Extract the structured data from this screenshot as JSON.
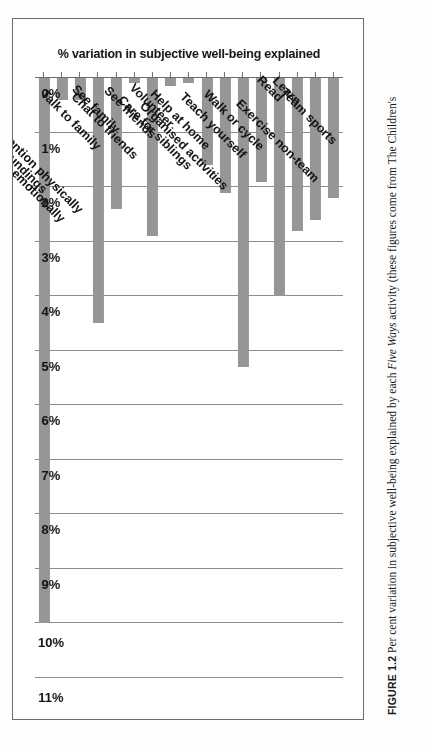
{
  "figure": {
    "label": "FIGURE 1.2",
    "caption_before": "Per cent variation in subjective well-being explained by each ",
    "caption_italic": "Five Ways",
    "caption_after": " activity (these figures come from The Children's"
  },
  "colors": {
    "bar": "#969696",
    "gridline": "#8d8d8d",
    "axis": "#6b6b6b",
    "text": "#111111",
    "frame": "#6b6b6b",
    "page_background": "#ffffff"
  },
  "chart_data": {
    "type": "bar",
    "orientation": "horizontal",
    "title": "",
    "xlabel": "% variation in subjective well-being explained",
    "ylabel": "",
    "xlim": [
      0,
      11
    ],
    "grid": true,
    "legend": null,
    "rotation_deg": 180,
    "tick_labels": [
      "0%",
      "1%",
      "2%",
      "3%",
      "4%",
      "5%",
      "6%",
      "7%",
      "8%",
      "9%",
      "10%",
      "11%"
    ],
    "tick_values": [
      0,
      1,
      2,
      3,
      4,
      5,
      6,
      7,
      8,
      9,
      10,
      11
    ],
    "categories": [
      "Team sports",
      "Exercise non-team",
      "Learn",
      "Read",
      "Walk or cycle",
      "Teach yourself",
      "Organised activities",
      "Help at home",
      "Care for siblings",
      "Volunteer",
      "See friends",
      "Chat to friends",
      "See family",
      "Talk to family",
      "Pay attention physically",
      "Pay attention emotionally",
      "Notice surroundings"
    ],
    "values": [
      2.2,
      2.6,
      2.8,
      4.0,
      1.9,
      5.3,
      2.1,
      1.6,
      0.1,
      0.15,
      2.9,
      0.1,
      2.4,
      4.5,
      0.4,
      0.4,
      10.0
    ],
    "value_unit": "%"
  }
}
